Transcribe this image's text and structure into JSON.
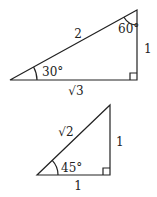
{
  "diagrams": [
    {
      "name": "30-60-90 triangle",
      "vertices": {
        "left": [
          10,
          80
        ],
        "right_angle": [
          137,
          80
        ],
        "top": [
          137,
          10
        ]
      },
      "labels": {
        "hypotenuse": "2",
        "vertical_leg": "1",
        "horizontal_leg": "√3",
        "angle_left": "30°",
        "angle_top": "60°"
      }
    },
    {
      "name": "45-45-90 triangle",
      "vertices": {
        "left": [
          37,
          175
        ],
        "right_angle": [
          110,
          175
        ],
        "top": [
          110,
          105
        ]
      },
      "labels": {
        "hypotenuse": "√2",
        "vertical_leg": "1",
        "horizontal_leg": "1",
        "angle_left": "45°"
      }
    }
  ],
  "colors": {
    "stroke": "#222222",
    "background": "#ffffff"
  }
}
